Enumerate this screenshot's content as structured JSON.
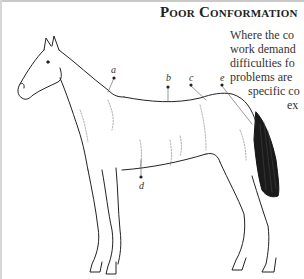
{
  "page": {
    "heading": "Poor Conformation",
    "body_lines": [
      {
        "text": "Where the co",
        "left": 230,
        "top": 28
      },
      {
        "text": "work demand",
        "left": 230,
        "top": 42
      },
      {
        "text": "difficulties fo",
        "left": 230,
        "top": 56
      },
      {
        "text": "problems are",
        "left": 230,
        "top": 70
      },
      {
        "text": "specific co",
        "left": 248,
        "top": 84
      },
      {
        "text": "ex",
        "left": 287,
        "top": 98
      }
    ]
  },
  "illustration": {
    "subject": "horse side-view line drawing",
    "labels": {
      "a": "a",
      "b": "b",
      "c": "c",
      "d": "d",
      "e": "e"
    }
  }
}
